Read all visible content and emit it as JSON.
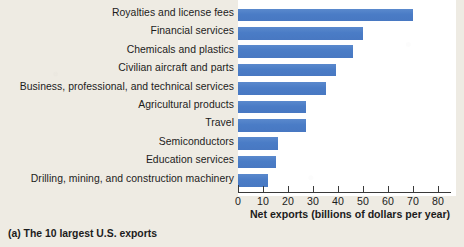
{
  "caption": "(a) The 10 largest U.S. exports",
  "colors": {
    "bar": "#4e80c8",
    "background": "#eeebe3",
    "panel": "#ffffff",
    "axis": "#3a3a3a",
    "text": "#1c1c1c"
  },
  "chart_data": {
    "type": "bar",
    "orientation": "horizontal",
    "title": "(a) The 10 largest U.S. exports",
    "xlabel": "Net exports (billions of dollars per year)",
    "ylabel": "",
    "xlim": [
      0,
      80
    ],
    "xticks": [
      0,
      10,
      20,
      30,
      40,
      50,
      60,
      70,
      80
    ],
    "xticklabels": [
      "0",
      "10",
      "20",
      "30",
      "40",
      "50",
      "60",
      "70",
      "80"
    ],
    "grid": false,
    "legend": false,
    "categories": [
      "Royalties and license fees",
      "Financial services",
      "Chemicals and plastics",
      "Civilian aircraft and parts",
      "Business, professional, and technical services",
      "Agricultural products",
      "Travel",
      "Semiconductors",
      "Education services",
      "Drilling, mining, and construction machinery"
    ],
    "values": [
      70,
      50,
      46,
      39,
      35,
      27,
      27,
      16,
      15,
      12
    ],
    "series": [
      {
        "name": "Net exports",
        "values": [
          70,
          50,
          46,
          39,
          35,
          27,
          27,
          16,
          15,
          12
        ]
      }
    ]
  }
}
